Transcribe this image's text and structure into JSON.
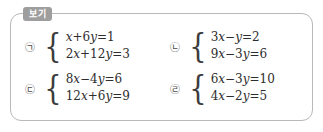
{
  "box": {
    "label": "보기",
    "border_color": "#b9b9b9",
    "label_bg_color": "#9e9e9e",
    "label_text_color": "#ffffff",
    "background_color": "#ffffff"
  },
  "items": [
    {
      "marker": "㉠",
      "brace": "{",
      "equations": [
        "x+6y=1",
        "2x+12y=3"
      ]
    },
    {
      "marker": "㉡",
      "brace": "{",
      "equations": [
        "3x−y=2",
        "9x−3y=6"
      ]
    },
    {
      "marker": "㉢",
      "brace": "{",
      "equations": [
        "8x−4y=6",
        "12x+6y=9"
      ]
    },
    {
      "marker": "㉣",
      "brace": "{",
      "equations": [
        "6x−3y=10",
        "4x−2y=5"
      ]
    }
  ]
}
